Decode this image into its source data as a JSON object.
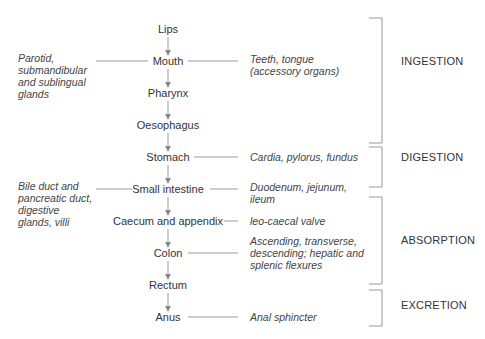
{
  "organs": [
    {
      "label": "Lips"
    },
    {
      "label": "Mouth"
    },
    {
      "label": "Pharynx"
    },
    {
      "label": "Oesophagus"
    },
    {
      "label": "Stomach"
    },
    {
      "label": "Small intestine"
    },
    {
      "label": "Caecum and appendix"
    },
    {
      "label": "Colon"
    },
    {
      "label": "Rectum"
    },
    {
      "label": "Anus"
    }
  ],
  "left_notes": {
    "mouth": "Parotid, submandibular and sublingual glands",
    "small_intestine": "Bile duct and pancreatic duct, digestive glands, villi"
  },
  "right_notes": {
    "mouth": "Teeth, tongue (accessory organs)",
    "stomach": "Cardia, pylorus, fundus",
    "small_intestine": "Duodenum, jejunum, ileum",
    "caecum": "leo-caecal valve",
    "colon": "Ascending, transverse, descending; hepatic and splenic flexures",
    "anus": "Anal sphincter"
  },
  "phases": [
    {
      "label": "INGESTION"
    },
    {
      "label": "DIGESTION"
    },
    {
      "label": "ABSORPTION"
    },
    {
      "label": "EXCRETION"
    }
  ]
}
